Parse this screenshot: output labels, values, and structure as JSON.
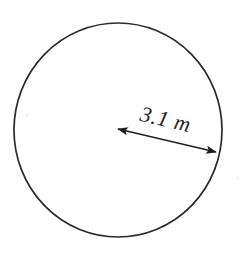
{
  "figure": {
    "kind": "geometry-diagram",
    "background_color": "#ffffff",
    "stroke_color": "#2b2b2b",
    "text_color": "#1f1f1f"
  },
  "shape": {
    "type": "circle",
    "center_x": 118,
    "center_y": 130,
    "radius_x": 104,
    "radius_y": 107,
    "stroke_width": 1.7
  },
  "dimension": {
    "label": "3.1 m",
    "value": "3.1",
    "unit": "m",
    "quantity": "radius",
    "rotation_deg": 13.2,
    "arrow": {
      "start_x": 118,
      "start_y": 129,
      "end_x": 216,
      "end_y": 152,
      "double_headed": true,
      "head_length": 11,
      "head_width": 8,
      "line_width": 1.4
    }
  },
  "artifacts": [
    {
      "name": "scan-speck-left",
      "x": 27,
      "y": 115,
      "r": 1.1,
      "opacity": 0.18
    },
    {
      "name": "scan-speck-right",
      "x": 238,
      "y": 178,
      "r": 1.1,
      "opacity": 0.14
    }
  ]
}
